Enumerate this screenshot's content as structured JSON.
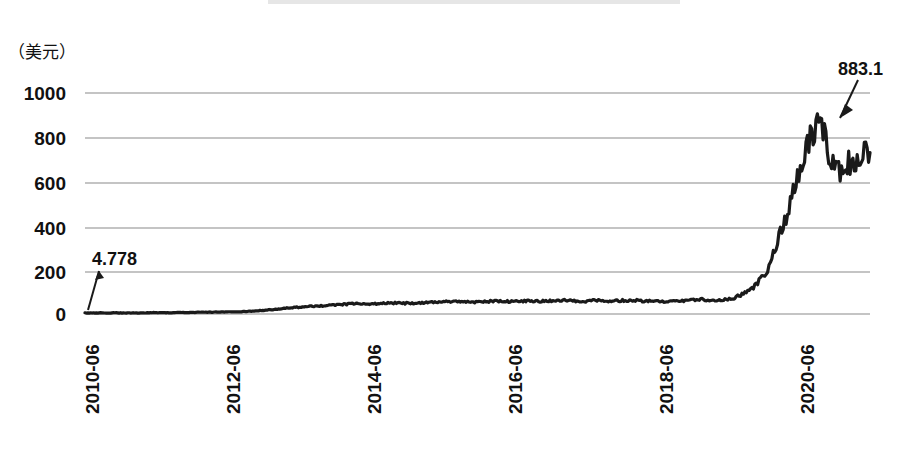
{
  "figure": {
    "redacted_title_present": true,
    "unit_label": "（美元）",
    "background_color": "#ffffff",
    "line_color": "#1a1a1a",
    "gridline_color": "#808080"
  },
  "annotations": [
    {
      "name": "start-value-callout",
      "text": "4.778",
      "x_px": 92,
      "y_px": 250,
      "arrow_from": [
        97,
        268
      ],
      "arrow_to": [
        86,
        308
      ]
    },
    {
      "name": "peak-value-callout",
      "text": "883.1",
      "x_px": 838,
      "y_px": 60,
      "arrow_from": [
        857,
        82
      ],
      "arrow_to": [
        838,
        116
      ]
    }
  ],
  "chart_data": {
    "type": "line",
    "title": "",
    "subtitle": "",
    "xlabel": "",
    "ylabel": "（美元）",
    "ylim": [
      0,
      1000
    ],
    "yticks": [
      0,
      200,
      400,
      600,
      800,
      1000
    ],
    "ytick_labels": [
      "0",
      "200",
      "400",
      "600",
      "800",
      "1000"
    ],
    "xtick_labels": [
      "2010-06",
      "2012-06",
      "2014-06",
      "2016-06",
      "2018-06",
      "2020-06"
    ],
    "xtick_positions_px": [
      90,
      231,
      372,
      513,
      664,
      805
    ],
    "grid": true,
    "legend": null,
    "legend_position": "none",
    "annotations": [
      "4.778",
      "883.1"
    ],
    "series": [
      {
        "name": "价格",
        "unit": "美元",
        "first_value": 4.778,
        "max_value": 883.1,
        "x": [
          "2010-06",
          "2010-09",
          "2010-12",
          "2011-03",
          "2011-06",
          "2011-09",
          "2011-12",
          "2012-03",
          "2012-06",
          "2012-09",
          "2012-12",
          "2013-03",
          "2013-06",
          "2013-09",
          "2013-12",
          "2014-03",
          "2014-06",
          "2014-09",
          "2014-12",
          "2015-03",
          "2015-06",
          "2015-09",
          "2015-12",
          "2016-03",
          "2016-06",
          "2016-09",
          "2016-12",
          "2017-03",
          "2017-06",
          "2017-09",
          "2017-12",
          "2018-03",
          "2018-06",
          "2018-09",
          "2018-12",
          "2019-03",
          "2019-06",
          "2019-09",
          "2019-12",
          "2020-03",
          "2020-06",
          "2020-09",
          "2020-12",
          "2021-03",
          "2021-06",
          "2021-09",
          "2021-12"
        ],
        "values": [
          4.778,
          5,
          5,
          5,
          6,
          6,
          7,
          8,
          9,
          10,
          14,
          20,
          28,
          33,
          38,
          44,
          47,
          46,
          50,
          48,
          52,
          55,
          57,
          54,
          58,
          56,
          60,
          58,
          62,
          57,
          61,
          59,
          63,
          58,
          55,
          60,
          66,
          63,
          70,
          110,
          190,
          420,
          700,
          883.1,
          640,
          700,
          730
        ]
      }
    ]
  }
}
